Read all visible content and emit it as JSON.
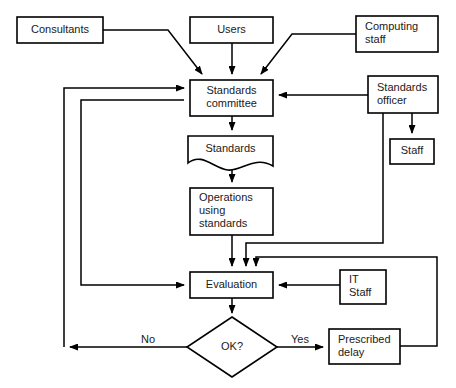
{
  "diagram": {
    "type": "flowchart",
    "colors": {
      "background": "#ffffff",
      "stroke": "#000000",
      "text": "#1a1a1a"
    },
    "nodes": [
      {
        "id": "consultants",
        "shape": "rectangle",
        "label": "Consultants",
        "lines": [
          "Consultants"
        ],
        "align": "center",
        "x": 17,
        "y": 17,
        "w": 86,
        "h": 26
      },
      {
        "id": "users",
        "shape": "rectangle",
        "label": "Users",
        "lines": [
          "Users"
        ],
        "align": "center",
        "x": 190,
        "y": 17,
        "w": 83,
        "h": 26
      },
      {
        "id": "computing-staff",
        "shape": "rectangle",
        "label": "Computing staff",
        "lines": [
          "Computing",
          "staff"
        ],
        "align": "left",
        "x": 356,
        "y": 16,
        "w": 82,
        "h": 36
      },
      {
        "id": "standards-committee",
        "shape": "rectangle",
        "label": "Standards committee",
        "lines": [
          "Standards",
          "committee"
        ],
        "align": "center",
        "x": 190,
        "y": 80,
        "w": 83,
        "h": 36
      },
      {
        "id": "standards-officer",
        "shape": "rectangle",
        "label": "Standards officer",
        "lines": [
          "Standards",
          "officer"
        ],
        "align": "left",
        "x": 368,
        "y": 76,
        "w": 70,
        "h": 37
      },
      {
        "id": "staff",
        "shape": "rectangle",
        "label": "Staff",
        "lines": [
          "Staff"
        ],
        "align": "center",
        "x": 390,
        "y": 139,
        "w": 44,
        "h": 25
      },
      {
        "id": "standards-document",
        "shape": "document",
        "label": "Standards",
        "lines": [
          "Standards"
        ],
        "align": "center",
        "x": 188,
        "y": 136,
        "w": 85,
        "h": 34
      },
      {
        "id": "operations-using-standards",
        "shape": "rectangle",
        "label": "Operations using standards",
        "lines": [
          "Operations",
          "using",
          "standards"
        ],
        "align": "left",
        "x": 190,
        "y": 188,
        "w": 83,
        "h": 47
      },
      {
        "id": "evaluation",
        "shape": "rectangle",
        "label": "Evaluation",
        "lines": [
          "Evaluation"
        ],
        "align": "center",
        "x": 190,
        "y": 272,
        "w": 83,
        "h": 26
      },
      {
        "id": "it-staff",
        "shape": "rectangle",
        "label": "IT Staff",
        "lines": [
          "IT",
          "Staff"
        ],
        "align": "left",
        "x": 340,
        "y": 270,
        "w": 46,
        "h": 34
      },
      {
        "id": "ok-decision",
        "shape": "diamond",
        "label": "OK?",
        "lines": [
          "OK?"
        ],
        "align": "center",
        "cx": 232,
        "cy": 347,
        "rx": 45,
        "ry": 30
      },
      {
        "id": "prescribed-delay",
        "shape": "rectangle",
        "label": "Prescribed delay",
        "lines": [
          "Prescribed",
          "delay"
        ],
        "align": "left",
        "x": 329,
        "y": 329,
        "w": 71,
        "h": 35
      }
    ],
    "edge_labels": [
      {
        "id": "no-label",
        "text": "No",
        "x": 148,
        "y": 340
      },
      {
        "id": "yes-label",
        "text": "Yes",
        "x": 300,
        "y": 340
      }
    ],
    "edges": [
      {
        "id": "consultants-to-committee",
        "from": "consultants",
        "to": "standards-committee",
        "path": "M103,30 L168,30 L202,74",
        "arrow": true
      },
      {
        "id": "users-to-committee",
        "from": "users",
        "to": "standards-committee",
        "path": "M232,43 L232,74",
        "arrow": true
      },
      {
        "id": "computing-staff-to-committee",
        "from": "computing-staff",
        "to": "standards-committee",
        "path": "M356,34 L292,34 L261,74",
        "arrow": true
      },
      {
        "id": "standards-officer-to-committee",
        "from": "standards-officer",
        "to": "standards-committee",
        "path": "M368,95 L279,95",
        "arrow": true
      },
      {
        "id": "standards-officer-to-staff",
        "from": "standards-officer",
        "to": "staff",
        "path": "M412,113 L412,133",
        "arrow": true
      },
      {
        "id": "committee-to-standards-doc",
        "from": "standards-committee",
        "to": "standards-document",
        "path": "M232,116 L232,130",
        "arrow": true
      },
      {
        "id": "standards-doc-to-operations",
        "from": "standards-document",
        "to": "operations-using-standards",
        "path": "M232,160 L232,182",
        "arrow": true
      },
      {
        "id": "operations-to-evaluation",
        "from": "operations-using-standards",
        "to": "evaluation",
        "path": "M232,235 L232,266",
        "arrow": true
      },
      {
        "id": "standards-officer-to-evaluation",
        "from": "standards-officer",
        "to": "evaluation",
        "path": "M383,113 L383,243 L246,243 L246,266",
        "arrow": true
      },
      {
        "id": "prescribed-delay-to-evaluation",
        "from": "prescribed-delay",
        "to": "evaluation",
        "path": "M400,346 L437,346 L437,257 L256,257 L256,266",
        "arrow": true
      },
      {
        "id": "it-staff-to-evaluation",
        "from": "it-staff",
        "to": "evaluation",
        "path": "M340,285 L279,285",
        "arrow": true
      },
      {
        "id": "evaluation-to-ok",
        "from": "evaluation",
        "to": "ok-decision",
        "path": "M232,298 L232,313",
        "arrow": true
      },
      {
        "id": "ok-no-to-left-bus",
        "from": "ok-decision",
        "to": "committee-feedback-outer",
        "path": "M187,347 L70,347",
        "arrow": true
      },
      {
        "id": "left-bus-outer-to-committee",
        "from": "ok-decision",
        "to": "standards-committee",
        "path": "M64,347 L64,88 L184,88",
        "arrow": true
      },
      {
        "id": "left-bus-inner-to-evaluation",
        "from": "standards-committee",
        "to": "evaluation",
        "path": "M184,100 L81,100 L81,285 L184,285",
        "arrow": true
      },
      {
        "id": "ok-yes-to-prescribed-delay",
        "from": "ok-decision",
        "to": "prescribed-delay",
        "path": "M277,347 L323,347",
        "arrow": true
      }
    ]
  }
}
